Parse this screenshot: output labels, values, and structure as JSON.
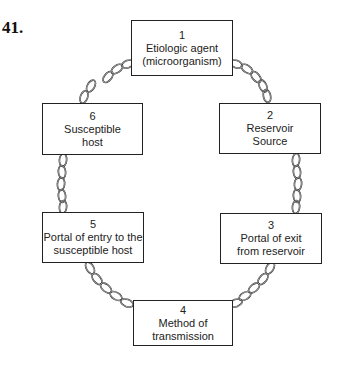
{
  "question_number": "41.",
  "diagram": {
    "nodes": [
      {
        "id": 1,
        "number": "1",
        "line1": "Etiologic agent",
        "line2": "(microorganism)"
      },
      {
        "id": 2,
        "number": "2",
        "line1": "Reservoir",
        "line2": "Source"
      },
      {
        "id": 3,
        "number": "3",
        "line1": "Portal of exit",
        "line2": "from reservoir"
      },
      {
        "id": 4,
        "number": "4",
        "line1": "Method of",
        "line2": "transmission"
      },
      {
        "id": 5,
        "number": "5",
        "line1": "Portal of entry to the",
        "line2": "susceptible host"
      },
      {
        "id": 6,
        "number": "6",
        "line1": "Susceptible",
        "line2": "host"
      }
    ],
    "links": [
      {
        "from": 1,
        "to": 2,
        "style": "chain"
      },
      {
        "from": 2,
        "to": 3,
        "style": "chain"
      },
      {
        "from": 3,
        "to": 4,
        "style": "chain"
      },
      {
        "from": 4,
        "to": 5,
        "style": "chain"
      },
      {
        "from": 5,
        "to": 6,
        "style": "chain"
      },
      {
        "from": 6,
        "to": 1,
        "style": "chain"
      }
    ]
  }
}
